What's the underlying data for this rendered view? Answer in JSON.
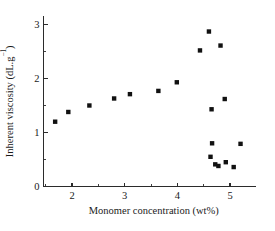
{
  "chart_data": {
    "type": "scatter",
    "title": "",
    "xlabel": "Monomer concentration (wt%)",
    "ylabel": "Inherent viscosity (dL.g⁻¹)",
    "ylabel_base": "Inherent viscosity (dL.g",
    "ylabel_exponent": "−1",
    "ylabel_tail": ")",
    "xlim": [
      1.4,
      5.5
    ],
    "ylim": [
      0,
      3.25
    ],
    "xticks": [
      2,
      3,
      4,
      5
    ],
    "yticks": [
      0,
      1,
      2,
      3
    ],
    "xticklabels": [
      "2",
      "3",
      "4",
      "5"
    ],
    "yticklabels": [
      "0",
      "1",
      "2",
      "3"
    ],
    "x_minor_ticks": [
      1.5,
      2.5,
      3.5,
      4.5
    ],
    "y_minor_ticks": [
      0.5,
      1.5,
      2.5
    ],
    "grid": false,
    "legend": null,
    "marker_style": "filled-square",
    "marker_color": "#111111",
    "series": [
      {
        "name": "Inherent viscosity vs monomer concentration",
        "points": [
          [
            1.68,
            1.2
          ],
          [
            1.93,
            1.38
          ],
          [
            2.33,
            1.5
          ],
          [
            2.8,
            1.63
          ],
          [
            3.1,
            1.71
          ],
          [
            3.64,
            1.77
          ],
          [
            3.99,
            1.93
          ],
          [
            4.43,
            2.52
          ],
          [
            4.6,
            2.87
          ],
          [
            4.82,
            2.61
          ],
          [
            4.9,
            1.62
          ],
          [
            4.65,
            1.43
          ],
          [
            4.66,
            0.8
          ],
          [
            5.2,
            0.79
          ],
          [
            4.63,
            0.55
          ],
          [
            4.72,
            0.41
          ],
          [
            4.78,
            0.38
          ],
          [
            4.92,
            0.45
          ],
          [
            5.07,
            0.36
          ]
        ]
      }
    ]
  },
  "figure": {
    "background_color": "#ffffff",
    "axis_color": "#2b2b2b"
  }
}
